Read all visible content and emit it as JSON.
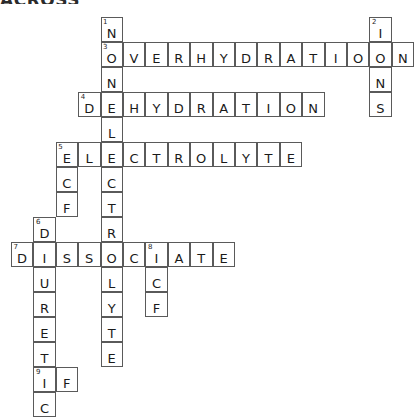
{
  "page": {
    "title_fragment": "ACROSS",
    "background_color": "#ffffff",
    "ink_color": "#1a1a1a",
    "grid_line_color": "#5a5a5a"
  },
  "grid": {
    "origin_x": 11,
    "origin_y": 17,
    "cell_width": 22.4,
    "cell_height": 25,
    "columns": 18,
    "rows": 16
  },
  "entries": [
    {
      "number": "1",
      "direction": "down",
      "answer": "NONELECTROLYTE",
      "start_col": 4,
      "start_row": 0
    },
    {
      "number": "2",
      "direction": "down",
      "answer": "IONS",
      "start_col": 16,
      "start_row": 0
    },
    {
      "number": "3",
      "direction": "across",
      "answer": "OVERHYDRATION",
      "start_col": 4,
      "start_row": 1
    },
    {
      "number": "4",
      "direction": "across",
      "answer": "DEHYDRATION",
      "start_col": 3,
      "start_row": 3
    },
    {
      "number": "5",
      "direction": "across",
      "answer": "ELECTROLYTE",
      "start_col": 2,
      "start_row": 5
    },
    {
      "number": "5",
      "direction": "down",
      "answer": "ECF",
      "start_col": 2,
      "start_row": 5
    },
    {
      "number": "6",
      "direction": "down",
      "answer": "DIURETIC",
      "start_col": 1,
      "start_row": 8
    },
    {
      "number": "7",
      "direction": "across",
      "answer": "DISSOCIATE",
      "start_col": 0,
      "start_row": 9
    },
    {
      "number": "8",
      "direction": "down",
      "answer": "ICF",
      "start_col": 5,
      "start_row": 9
    },
    {
      "number": "9",
      "direction": "across",
      "answer": "IF",
      "start_col": 1,
      "start_row": 14
    }
  ],
  "cells": [
    {
      "col": 4,
      "row": 0,
      "letter": "N",
      "clue": "1"
    },
    {
      "col": 16,
      "row": 0,
      "letter": "I",
      "clue": "2"
    },
    {
      "col": 4,
      "row": 1,
      "letter": "O",
      "clue": "3"
    },
    {
      "col": 5,
      "row": 1,
      "letter": "V",
      "clue": ""
    },
    {
      "col": 6,
      "row": 1,
      "letter": "E",
      "clue": ""
    },
    {
      "col": 7,
      "row": 1,
      "letter": "R",
      "clue": ""
    },
    {
      "col": 8,
      "row": 1,
      "letter": "H",
      "clue": ""
    },
    {
      "col": 9,
      "row": 1,
      "letter": "Y",
      "clue": ""
    },
    {
      "col": 10,
      "row": 1,
      "letter": "D",
      "clue": ""
    },
    {
      "col": 11,
      "row": 1,
      "letter": "R",
      "clue": ""
    },
    {
      "col": 12,
      "row": 1,
      "letter": "A",
      "clue": ""
    },
    {
      "col": 13,
      "row": 1,
      "letter": "T",
      "clue": ""
    },
    {
      "col": 14,
      "row": 1,
      "letter": "I",
      "clue": ""
    },
    {
      "col": 15,
      "row": 1,
      "letter": "O",
      "clue": ""
    },
    {
      "col": 16,
      "row": 1,
      "letter": "O",
      "clue": ""
    },
    {
      "col": 17,
      "row": 1,
      "letter": "N",
      "clue": ""
    },
    {
      "col": 4,
      "row": 2,
      "letter": "N",
      "clue": ""
    },
    {
      "col": 16,
      "row": 2,
      "letter": "N",
      "clue": ""
    },
    {
      "col": 3,
      "row": 3,
      "letter": "D",
      "clue": "4"
    },
    {
      "col": 4,
      "row": 3,
      "letter": "E",
      "clue": ""
    },
    {
      "col": 5,
      "row": 3,
      "letter": "H",
      "clue": ""
    },
    {
      "col": 6,
      "row": 3,
      "letter": "Y",
      "clue": ""
    },
    {
      "col": 7,
      "row": 3,
      "letter": "D",
      "clue": ""
    },
    {
      "col": 8,
      "row": 3,
      "letter": "R",
      "clue": ""
    },
    {
      "col": 9,
      "row": 3,
      "letter": "A",
      "clue": ""
    },
    {
      "col": 10,
      "row": 3,
      "letter": "T",
      "clue": ""
    },
    {
      "col": 11,
      "row": 3,
      "letter": "I",
      "clue": ""
    },
    {
      "col": 12,
      "row": 3,
      "letter": "O",
      "clue": ""
    },
    {
      "col": 13,
      "row": 3,
      "letter": "N",
      "clue": ""
    },
    {
      "col": 16,
      "row": 3,
      "letter": "S",
      "clue": ""
    },
    {
      "col": 4,
      "row": 4,
      "letter": "L",
      "clue": ""
    },
    {
      "col": 2,
      "row": 5,
      "letter": "E",
      "clue": "5"
    },
    {
      "col": 3,
      "row": 5,
      "letter": "L",
      "clue": ""
    },
    {
      "col": 4,
      "row": 5,
      "letter": "E",
      "clue": ""
    },
    {
      "col": 5,
      "row": 5,
      "letter": "C",
      "clue": ""
    },
    {
      "col": 6,
      "row": 5,
      "letter": "T",
      "clue": ""
    },
    {
      "col": 7,
      "row": 5,
      "letter": "R",
      "clue": ""
    },
    {
      "col": 8,
      "row": 5,
      "letter": "O",
      "clue": ""
    },
    {
      "col": 9,
      "row": 5,
      "letter": "L",
      "clue": ""
    },
    {
      "col": 10,
      "row": 5,
      "letter": "Y",
      "clue": ""
    },
    {
      "col": 11,
      "row": 5,
      "letter": "T",
      "clue": ""
    },
    {
      "col": 12,
      "row": 5,
      "letter": "E",
      "clue": ""
    },
    {
      "col": 2,
      "row": 6,
      "letter": "C",
      "clue": ""
    },
    {
      "col": 4,
      "row": 6,
      "letter": "C",
      "clue": ""
    },
    {
      "col": 2,
      "row": 7,
      "letter": "F",
      "clue": ""
    },
    {
      "col": 4,
      "row": 7,
      "letter": "T",
      "clue": ""
    },
    {
      "col": 1,
      "row": 8,
      "letter": "D",
      "clue": "6"
    },
    {
      "col": 4,
      "row": 8,
      "letter": "R",
      "clue": ""
    },
    {
      "col": 0,
      "row": 9,
      "letter": "D",
      "clue": "7"
    },
    {
      "col": 1,
      "row": 9,
      "letter": "I",
      "clue": ""
    },
    {
      "col": 2,
      "row": 9,
      "letter": "S",
      "clue": ""
    },
    {
      "col": 3,
      "row": 9,
      "letter": "S",
      "clue": ""
    },
    {
      "col": 4,
      "row": 9,
      "letter": "O",
      "clue": ""
    },
    {
      "col": 5,
      "row": 9,
      "letter": "C",
      "clue": ""
    },
    {
      "col": 6,
      "row": 9,
      "letter": "I",
      "clue": "8"
    },
    {
      "col": 7,
      "row": 9,
      "letter": "A",
      "clue": ""
    },
    {
      "col": 8,
      "row": 9,
      "letter": "T",
      "clue": ""
    },
    {
      "col": 9,
      "row": 9,
      "letter": "E",
      "clue": ""
    },
    {
      "col": 1,
      "row": 10,
      "letter": "U",
      "clue": ""
    },
    {
      "col": 4,
      "row": 10,
      "letter": "L",
      "clue": ""
    },
    {
      "col": 6,
      "row": 10,
      "letter": "C",
      "clue": ""
    },
    {
      "col": 1,
      "row": 11,
      "letter": "R",
      "clue": ""
    },
    {
      "col": 4,
      "row": 11,
      "letter": "Y",
      "clue": ""
    },
    {
      "col": 6,
      "row": 11,
      "letter": "F",
      "clue": ""
    },
    {
      "col": 1,
      "row": 12,
      "letter": "E",
      "clue": ""
    },
    {
      "col": 4,
      "row": 12,
      "letter": "T",
      "clue": ""
    },
    {
      "col": 1,
      "row": 13,
      "letter": "T",
      "clue": ""
    },
    {
      "col": 4,
      "row": 13,
      "letter": "E",
      "clue": ""
    },
    {
      "col": 1,
      "row": 14,
      "letter": "I",
      "clue": "9"
    },
    {
      "col": 2,
      "row": 14,
      "letter": "F",
      "clue": ""
    },
    {
      "col": 1,
      "row": 15,
      "letter": "C",
      "clue": ""
    }
  ]
}
